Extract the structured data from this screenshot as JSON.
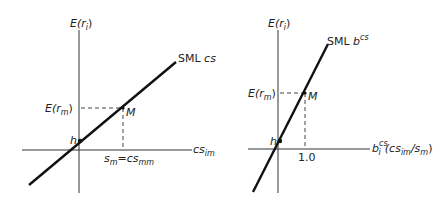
{
  "left_panel": {
    "y_axis_label": "E(r",
    "y_axis_label_sub": "i",
    "x_axis_label": "cs",
    "x_axis_label_sub": "im",
    "line_label": "SML",
    "line_label_suffix": "cs",
    "point_label": "M",
    "intercept_label": "h",
    "y_tick_label": "E(r",
    "y_tick_label_sub": "m",
    "x_tick_label_s": "s",
    "x_tick_label_s_sub": "m",
    "x_tick_label_eq": "=cs",
    "x_tick_label_eq_sub": "mm"
  },
  "right_panel": {
    "y_axis_label": "E(r",
    "y_axis_label_sub": "i",
    "x_axis_label_b": "b",
    "x_axis_label_b_sub": "i",
    "x_axis_label_b_sup": "cs",
    "x_axis_label_paren": "(cs",
    "x_axis_label_paren_sub": "im",
    "x_axis_label_div": "/s",
    "x_axis_label_div_sub": "m",
    "x_axis_label_close": ")",
    "line_label": "SML",
    "line_label_b": "b",
    "line_label_sup": "cs",
    "point_label": "M",
    "intercept_label": "h",
    "y_tick_label": "E(r",
    "y_tick_label_sub": "m",
    "x_tick_label": "1.0"
  },
  "colors": {
    "line": "#111111",
    "axis": "#333333",
    "dash": "#444444"
  }
}
